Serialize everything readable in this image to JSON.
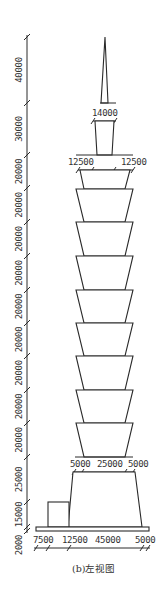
{
  "caption": "(b)左视图",
  "vertical_dimensions": [
    {
      "label": "40000",
      "y1": 37,
      "y2": 103
    },
    {
      "label": "30000",
      "y1": 103,
      "y2": 155
    },
    {
      "label": "20000",
      "y1": 155,
      "y2": 188
    },
    {
      "label": "20000",
      "y1": 188,
      "y2": 222
    },
    {
      "label": "20000",
      "y1": 222,
      "y2": 256
    },
    {
      "label": "20000",
      "y1": 256,
      "y2": 290
    },
    {
      "label": "20000",
      "y1": 290,
      "y2": 323
    },
    {
      "label": "20000",
      "y1": 323,
      "y2": 356
    },
    {
      "label": "20000",
      "y1": 356,
      "y2": 390
    },
    {
      "label": "20000",
      "y1": 390,
      "y2": 423
    },
    {
      "label": "20000",
      "y1": 423,
      "y2": 457
    },
    {
      "label": "25000",
      "y1": 457,
      "y2": 502
    },
    {
      "label": "15000",
      "y1": 502,
      "y2": 527
    },
    {
      "label": "2000",
      "y1": 527,
      "y2": 531
    }
  ],
  "spire": {
    "top_width_label": "14000"
  },
  "crown": {
    "left_label": "12500",
    "right_label": "12500",
    "center_label": "10000"
  },
  "base_top": {
    "left_label": "5000",
    "center_label": "25000",
    "right_label": "5000"
  },
  "base_bottom": {
    "labels": [
      "7500",
      "12500",
      "45000",
      "5000"
    ]
  },
  "tiers_count": 8
}
